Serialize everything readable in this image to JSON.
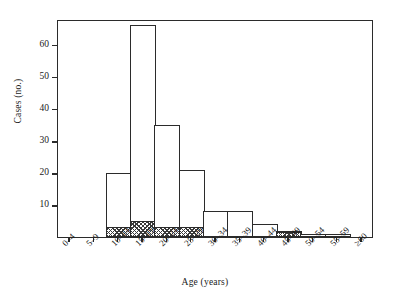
{
  "chart_data": {
    "type": "bar",
    "title": "",
    "subtitle": "",
    "xlabel": "Age (years)",
    "ylabel": "Cases (no.)",
    "categories": [
      "0–4",
      "5–9",
      "10–14",
      "15–19",
      "20–24",
      "25–29",
      "30–34",
      "35–39",
      "40–44",
      "45–49",
      "50–54",
      "55–59",
      "≥60"
    ],
    "values": [
      0,
      0,
      20,
      66,
      35,
      21,
      8,
      8,
      4,
      2,
      1,
      1,
      0
    ],
    "series": [
      {
        "name": "Total cases",
        "values": [
          0,
          0,
          20,
          66,
          35,
          21,
          8,
          8,
          4,
          2,
          1,
          1,
          0
        ]
      },
      {
        "name": "Hatched subgroup",
        "values": [
          0,
          0,
          3,
          5,
          3,
          3,
          0,
          0,
          0,
          1.5,
          0,
          0,
          0
        ]
      }
    ],
    "ylim": [
      0,
      68
    ],
    "yticks": [
      10,
      20,
      30,
      40,
      50,
      60
    ],
    "ytick_labels": [
      "10",
      "20",
      "30",
      "40",
      "50",
      "60"
    ],
    "grid": false,
    "legend": "none",
    "bar_style": "histogram, white fill with black outline; lower portion of some bars cross-hatched"
  },
  "axes": {
    "y_title": "Cases (no.)",
    "x_title": "Age (years)"
  }
}
